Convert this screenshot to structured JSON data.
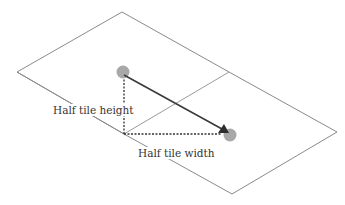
{
  "diagram": {
    "labels": {
      "half_tile_height": "Half tile height",
      "half_tile_width": "Half tile width"
    },
    "colors": {
      "tile_outline": "#8a8a8a",
      "arrow": "#3a3a3a",
      "dotted": "#333333",
      "marker": "#a8a8a8",
      "background": "#ffffff"
    },
    "geometry": {
      "outer_top": [
        122,
        12
      ],
      "outer_left": [
        17,
        72
      ],
      "outer_right": [
        337,
        132
      ],
      "outer_bottom": [
        232,
        194
      ],
      "shared_edge_top": [
        229,
        72
      ],
      "shared_edge_bottom": [
        124,
        134
      ],
      "start_marker": [
        124,
        74
      ],
      "end_marker": [
        230,
        134
      ],
      "right_angle_corner": [
        124,
        134
      ]
    }
  }
}
